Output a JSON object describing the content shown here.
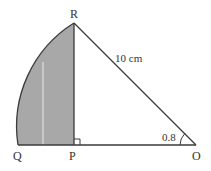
{
  "diagram": {
    "points": {
      "R": {
        "label": "R",
        "x": 74,
        "y": 23
      },
      "P": {
        "label": "P",
        "x": 74,
        "y": 145
      },
      "Q": {
        "label": "Q",
        "x": 18,
        "y": 145
      },
      "O": {
        "label": "O",
        "x": 196,
        "y": 145
      }
    },
    "hypotenuse_label": "10 cm",
    "angle_label": "0.8",
    "colors": {
      "shaded": "#a8a8a8",
      "stroke": "#3a3a3a",
      "background": "#ffffff"
    }
  }
}
